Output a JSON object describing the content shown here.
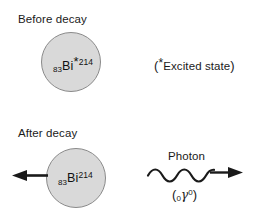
{
  "figure": {
    "background_color": "#ffffff",
    "width": 260,
    "height": 214
  },
  "panels": {
    "before": {
      "caption": "Before decay",
      "nuclide": {
        "atomic_number": "83",
        "symbol": "Bi",
        "excited_marker": "*",
        "mass_number": "214",
        "full_text": "83Bi*214"
      },
      "nucleus_fill": "#d9d9d9",
      "nucleus_stroke": "#8a8a8a"
    },
    "after": {
      "caption": "After decay",
      "nuclide": {
        "atomic_number": "83",
        "symbol": "Bi",
        "excited_marker": "",
        "mass_number": "214",
        "full_text": "83Bi214"
      },
      "nucleus_fill": "#d9d9d9",
      "nucleus_stroke": "#8a8a8a"
    }
  },
  "annotations": {
    "excited_state_note": {
      "open_paren": "(",
      "star": "*",
      "text": "Excited state",
      "close_paren": ")",
      "full_text": "(*Excited state)"
    },
    "photon_label": "Photon",
    "photon_symbol": {
      "open_paren": "(",
      "subscript": "0",
      "glyph": "γ",
      "superscript": "0",
      "close_paren": ")",
      "full_text": "(0γ0)"
    }
  },
  "arrows": {
    "recoil": {
      "name": "recoil-arrow",
      "direction": "left",
      "color": "#1a1a1a"
    },
    "photon": {
      "name": "photon-wave-arrow",
      "direction": "right",
      "color": "#1a1a1a",
      "style": "sinusoidal"
    }
  }
}
